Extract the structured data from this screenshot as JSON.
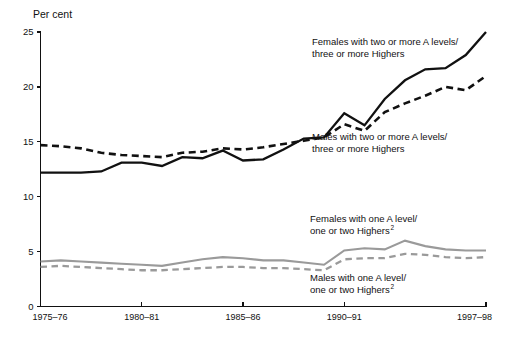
{
  "chart_data": {
    "type": "line",
    "title": "",
    "subtitle": "",
    "xlabel": "",
    "ylabel": "Per cent",
    "ylim": [
      0,
      25
    ],
    "yticks": [
      0,
      5,
      10,
      15,
      20,
      25
    ],
    "ytick_labels": [
      "0",
      "5",
      "10",
      "15",
      "20",
      "25"
    ],
    "grid": false,
    "legend_position": "inline-annotations",
    "x": [
      "1975-76",
      "1976-77",
      "1977-78",
      "1978-79",
      "1979-80",
      "1980-81",
      "1981-82",
      "1982-83",
      "1983-84",
      "1984-85",
      "1985-86",
      "1986-87",
      "1987-88",
      "1988-89",
      "1989-90",
      "1990-91",
      "1991-92",
      "1992-93",
      "1993-94",
      "1994-95",
      "1995-96",
      "1996-97",
      "1997-98"
    ],
    "xtick_labels": [
      "1975–76",
      "1980–81",
      "1985–86",
      "1990–91",
      "1997–98"
    ],
    "xtick_indices": [
      0,
      5,
      10,
      15,
      22
    ],
    "series": [
      {
        "name": "Females with two or more A levels/three or more Highers",
        "style": "solid",
        "color": "#111111",
        "values": [
          12.2,
          12.2,
          12.2,
          12.3,
          13.1,
          13.1,
          12.8,
          13.6,
          13.5,
          14.2,
          13.3,
          13.4,
          14.3,
          15.3,
          15.4,
          17.6,
          16.5,
          18.9,
          20.6,
          21.6,
          21.7,
          22.9,
          25.0
        ]
      },
      {
        "name": "Males with two or more A levels/three or more Highers",
        "style": "dashed",
        "color": "#111111",
        "values": [
          14.7,
          14.6,
          14.4,
          14.0,
          13.8,
          13.7,
          13.6,
          14.0,
          14.1,
          14.4,
          14.3,
          14.5,
          14.8,
          15.1,
          15.4,
          16.6,
          16.0,
          17.7,
          18.5,
          19.2,
          20.0,
          19.7,
          21.0
        ]
      },
      {
        "name": "Females with one A level/one or two Highers",
        "style": "solid",
        "color": "#9a9a9a",
        "values": [
          4.1,
          4.2,
          4.1,
          4.0,
          3.9,
          3.8,
          3.7,
          4.0,
          4.3,
          4.5,
          4.4,
          4.2,
          4.2,
          4.0,
          3.8,
          5.1,
          5.3,
          5.2,
          6.0,
          5.5,
          5.2,
          5.1,
          5.1
        ]
      },
      {
        "name": "Males with one A level/one or two Highers",
        "style": "dashed",
        "color": "#9a9a9a",
        "values": [
          3.6,
          3.7,
          3.6,
          3.5,
          3.4,
          3.3,
          3.3,
          3.4,
          3.5,
          3.6,
          3.6,
          3.5,
          3.5,
          3.4,
          3.3,
          4.3,
          4.4,
          4.4,
          4.8,
          4.7,
          4.5,
          4.4,
          4.5
        ]
      }
    ],
    "annotations": [
      {
        "id": "females-two-or-more",
        "line1": "Females with two or more A levels/",
        "line2": "three or more Highers",
        "superscript": ""
      },
      {
        "id": "males-two-or-more",
        "line1": "Males with two or more A levels/",
        "line2": "three or more Highers",
        "superscript": ""
      },
      {
        "id": "females-one-a-level",
        "line1": "Females with one A level/",
        "line2": "one or two Highers",
        "superscript": "2"
      },
      {
        "id": "males-one-a-level",
        "line1": "Males with one A level/",
        "line2": "one or two Highers",
        "superscript": "2"
      }
    ]
  }
}
